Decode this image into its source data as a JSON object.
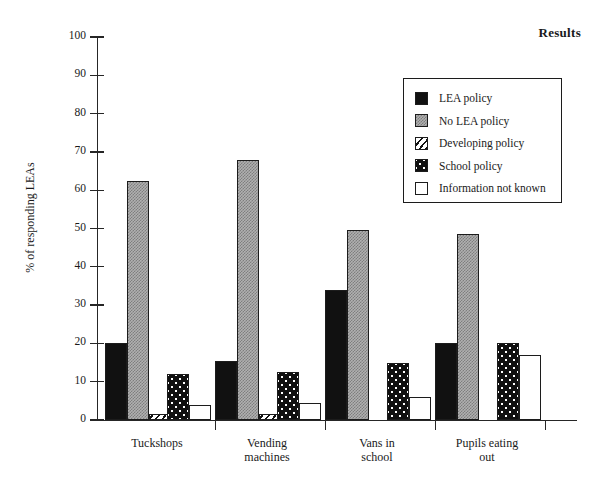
{
  "title": "Results",
  "ylabel": "% of responding LEAs",
  "chart_data": {
    "type": "bar",
    "title": "Results",
    "xlabel": "",
    "ylabel": "% of responding LEAs",
    "ylim": [
      0,
      100
    ],
    "yticks": [
      0,
      10,
      20,
      30,
      40,
      50,
      60,
      70,
      80,
      90,
      100
    ],
    "grid": false,
    "legend_position": "upper right",
    "categories": [
      "Tuckshops",
      "Vending machines",
      "Vans in school",
      "Pupils eating out"
    ],
    "category_label_lines": [
      [
        "Tuckshops"
      ],
      [
        "Vending",
        "machines"
      ],
      [
        "Vans in",
        "school"
      ],
      [
        "Pupils eating",
        "out"
      ]
    ],
    "series": [
      {
        "name": "LEA policy",
        "pattern": "solid-black",
        "values": [
          20.0,
          15.5,
          34.0,
          20.0
        ]
      },
      {
        "name": "No LEA policy",
        "pattern": "grey-stipple",
        "values": [
          62.5,
          68.0,
          49.5,
          48.5
        ]
      },
      {
        "name": "Developing policy",
        "pattern": "diagonal-hatch",
        "values": [
          1.5,
          1.5,
          0.0,
          0.0
        ]
      },
      {
        "name": "School policy",
        "pattern": "dotted-black",
        "values": [
          12.0,
          12.5,
          15.0,
          20.0
        ]
      },
      {
        "name": "Information not known",
        "pattern": "white-open",
        "values": [
          4.0,
          4.5,
          6.0,
          17.0
        ]
      }
    ]
  },
  "legend": {
    "items": [
      {
        "label": "LEA policy"
      },
      {
        "label": "No LEA policy"
      },
      {
        "label": "Developing policy"
      },
      {
        "label": "School policy"
      },
      {
        "label": "Information not known"
      }
    ]
  },
  "colors": {
    "axis": "#262626",
    "lea": "#111111",
    "nolea": "#b0b0b0",
    "developing": "#ffffff",
    "school": "#101010",
    "unknown": "#ffffff"
  }
}
